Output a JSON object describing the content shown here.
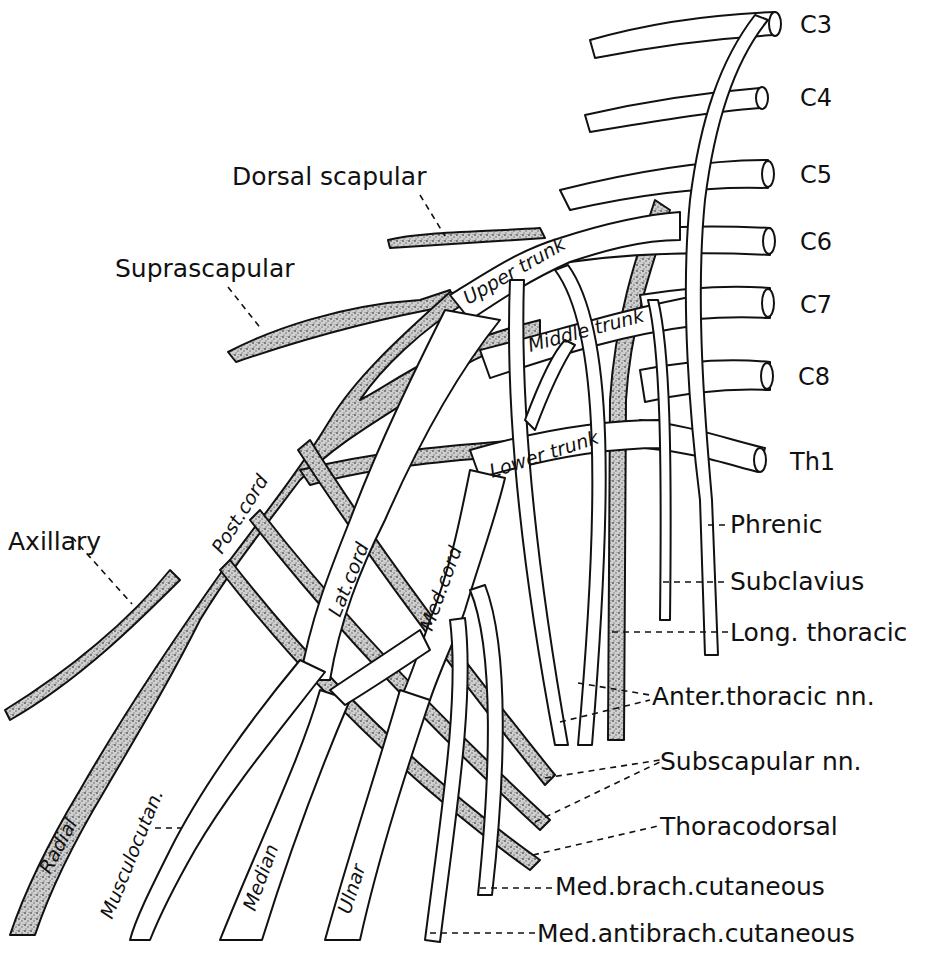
{
  "diagram": {
    "roots": [
      {
        "id": "c3",
        "label": "C3"
      },
      {
        "id": "c4",
        "label": "C4"
      },
      {
        "id": "c5",
        "label": "C5"
      },
      {
        "id": "c6",
        "label": "C6"
      },
      {
        "id": "c7",
        "label": "C7"
      },
      {
        "id": "c8",
        "label": "C8"
      },
      {
        "id": "th1",
        "label": "Th1"
      }
    ],
    "trunks": {
      "upper": "Upper trunk",
      "middle": "Middle trunk",
      "lower": "Lower trunk"
    },
    "cords": {
      "posterior": "Post.cord",
      "lateral": "Lat.cord",
      "medial": "Med.cord"
    },
    "terminal_branches": {
      "radial": "Radial",
      "musculocutaneous": "Musculocutan.",
      "median": "Median",
      "ulnar": "Ulnar"
    },
    "left_labels": {
      "dorsal_scapular": "Dorsal scapular",
      "suprascapular": "Suprascapular",
      "axillary": "Axillary"
    },
    "right_labels": {
      "phrenic": "Phrenic",
      "subclavius": "Subclavius",
      "long_thoracic": "Long. thoracic",
      "anterior_thoracic": "Anter.thoracic nn.",
      "subscapular": "Subscapular nn.",
      "thoracodorsal": "Thoracodorsal",
      "med_brach_cutaneous": "Med.brach.cutaneous",
      "med_antibrach_cutaneous": "Med.antibrach.cutaneous"
    },
    "colors": {
      "line": "#111111",
      "background": "#ffffff",
      "posterior_fill": "#b8b8b8"
    }
  }
}
